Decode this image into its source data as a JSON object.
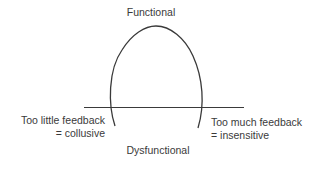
{
  "diagram": {
    "title": "",
    "top_label": "Functional",
    "bottom_label": "Dysfunctional",
    "left_label": {
      "line1": "Too little feedback",
      "line2": "= collusive"
    },
    "right_label": {
      "line1": "Too much feedback",
      "line2": "= insensitive"
    },
    "colors": {
      "stroke": "#3a3a3a",
      "text": "#3a3a3a",
      "background": "#ffffff"
    }
  }
}
